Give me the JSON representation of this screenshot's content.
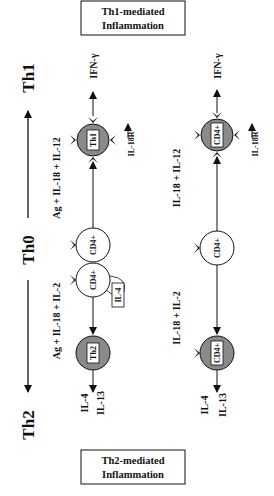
{
  "header": {
    "th2_label": "Th2",
    "th0_label": "Th0",
    "th1_label": "Th1"
  },
  "row1": {
    "th2_stimulus": "Ag + IL-18 + IL-2",
    "th1_stimulus": "Ag + IL-18 + IL-12",
    "th2_cell": "Th2",
    "cd4_left": "CD4+",
    "cd4_right": "CD4+",
    "th1_cell": "Th1",
    "il4_feedback": "IL-4",
    "th2_out_1": "IL-4",
    "th2_out_2": "IL-13",
    "th1_out": "IFN-γ",
    "receptor": "IL-18R"
  },
  "row2": {
    "th2_stimulus": "IL-18 + IL-2",
    "th1_stimulus": "IL-18 + IL-12",
    "left_cell": "CD4+",
    "center_cell": "CD4+",
    "right_cell": "CD4+",
    "th2_out_1": "IL-4",
    "th2_out_2": "IL-13",
    "th1_out": "IFN-γ",
    "receptor": "IL-18R"
  },
  "boxes": {
    "th1_line1": "Th1-mediated",
    "th1_line2": "Inflammation",
    "th2_line1": "Th2-mediated",
    "th2_line2": "Inflammation"
  },
  "colors": {
    "cell_fill_differentiated": "#8a8a8a",
    "cell_fill_naive": "#ffffff",
    "ink": "#111111"
  }
}
